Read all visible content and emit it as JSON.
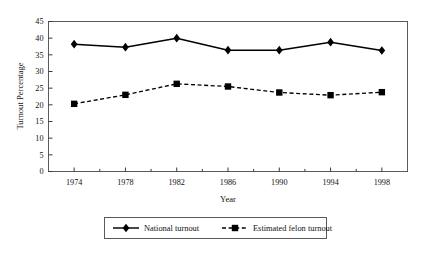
{
  "chart_data": {
    "type": "line",
    "title": "",
    "xlabel": "Year",
    "ylabel": "Turnout Percentage",
    "x": [
      1974,
      1978,
      1982,
      1986,
      1990,
      1994,
      1998
    ],
    "categories": [
      "1974",
      "1978",
      "1982",
      "1986",
      "1990",
      "1994",
      "1998"
    ],
    "xlim": [
      1972,
      2000
    ],
    "ylim": [
      0,
      45
    ],
    "ytick_step": 5,
    "yticks": [
      0,
      5,
      10,
      15,
      20,
      25,
      30,
      35,
      40,
      45
    ],
    "ytick_labels": [
      "0",
      "5",
      "10",
      "15",
      "20",
      "25",
      "30",
      "35",
      "40",
      "45"
    ],
    "grid": false,
    "minor_ticks_x": true,
    "legend_position": "bottom",
    "series": [
      {
        "name": "National turnout",
        "marker": "diamond",
        "line_style": "solid",
        "color": "#000000",
        "values": [
          38.2,
          37.3,
          40.0,
          36.4,
          36.4,
          38.8,
          36.3
        ]
      },
      {
        "name": "Estimated felon turnout",
        "marker": "square",
        "line_style": "dashed",
        "color": "#000000",
        "values": [
          20.3,
          23.0,
          26.3,
          25.5,
          23.7,
          22.9,
          23.8
        ]
      }
    ]
  },
  "axes": {
    "y_title": "Turnout Percentage",
    "x_title": "Year"
  },
  "legend": {
    "items": [
      {
        "label": "National turnout"
      },
      {
        "label": "Estimated felon turnout"
      }
    ]
  }
}
